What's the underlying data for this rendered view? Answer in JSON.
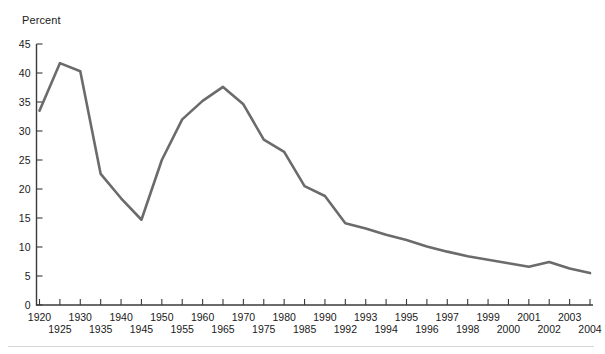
{
  "chart_data": {
    "type": "line",
    "title": "",
    "subtitle": "",
    "ylabel": "Percent",
    "xlabel": "",
    "ylim": [
      0,
      45
    ],
    "yticks": [
      0,
      5,
      10,
      15,
      20,
      25,
      30,
      35,
      40,
      45
    ],
    "grid": false,
    "legend": null,
    "legend_position": "none",
    "line_color": "#6b6b6b",
    "axis_color": "#3a3a3a",
    "categories": [
      "1920",
      "1925",
      "1930",
      "1935",
      "1940",
      "1945",
      "1950",
      "1955",
      "1960",
      "1965",
      "1970",
      "1975",
      "1980",
      "1985",
      "1990",
      "1992",
      "1993",
      "1994",
      "1995",
      "1996",
      "1997",
      "1998",
      "1999",
      "2000",
      "2001",
      "2002",
      "2003",
      "2004"
    ],
    "xtick_labels_upper": [
      "1920",
      "",
      "1930",
      "",
      "1940",
      "",
      "1950",
      "",
      "1960",
      "",
      "1970",
      "",
      "1980",
      "",
      "1990",
      "",
      "1993",
      "",
      "1995",
      "",
      "1997",
      "",
      "1999",
      "",
      "2001",
      "",
      "2003",
      ""
    ],
    "xtick_labels_lower": [
      "",
      "1925",
      "",
      "1935",
      "",
      "1945",
      "",
      "1955",
      "",
      "1965",
      "",
      "1975",
      "",
      "1985",
      "",
      "1992",
      "",
      "1994",
      "",
      "1996",
      "",
      "1998",
      "",
      "2000",
      "",
      "2002",
      "",
      "2004"
    ],
    "values": [
      33.5,
      41.7,
      40.3,
      22.6,
      18.4,
      14.7,
      25.0,
      32.0,
      35.2,
      37.6,
      34.6,
      28.5,
      26.4,
      20.5,
      18.8,
      14.1,
      13.2,
      12.1,
      11.2,
      10.1,
      9.2,
      8.4,
      7.8,
      7.2,
      6.6,
      7.4,
      6.3,
      5.5
    ]
  },
  "accessibility": {
    "series_name": "percent"
  }
}
